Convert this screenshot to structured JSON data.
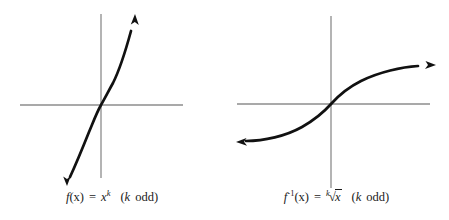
{
  "figures": [
    {
      "id": "power-function",
      "name": "odd-power-function-graph",
      "caption": {
        "fn_name": "f",
        "arg": "(x)",
        "equals": "=",
        "base": "x",
        "exponent": "k",
        "condition_open": "(",
        "condition_var": "k",
        "condition_text": "odd",
        "condition_close": ")",
        "plain": "f(x) = x^k  (k odd)"
      },
      "axes": {
        "x_axis": {
          "x1": 20,
          "y1": 105,
          "x2": 183,
          "y2": 105
        },
        "y_axis": {
          "x1": 101,
          "y1": 14,
          "x2": 101,
          "y2": 178
        },
        "color": "#8c8c8c"
      },
      "curve": {
        "color": "#111111",
        "width": 2.6,
        "path": "M 67 181 C 74 166 82 146 89 131 C 94 120 97 112 101 105 C 105 98 108 92 114 82 C 121 68 127 50 133 26",
        "arrow_start": {
          "x": 67,
          "y": 185,
          "direction": "down-left"
        },
        "arrow_end": {
          "x": 135,
          "y": 15,
          "direction": "up-right"
        }
      }
    },
    {
      "id": "inverse-root-function",
      "name": "odd-root-function-graph",
      "caption": {
        "fn_name": "f",
        "inverse_exponent": "-1",
        "arg": "(x)",
        "equals": "=",
        "radical_index": "k",
        "radical_sign": "√",
        "radicand": "x",
        "condition_open": "(",
        "condition_var": "k",
        "condition_text": "odd",
        "condition_close": ")",
        "plain": "f^-1(x) = k-th-root of x  (k odd)"
      },
      "axes": {
        "x_axis": {
          "x1": 13,
          "y1": 104,
          "x2": 206,
          "y2": 104
        },
        "y_axis": {
          "x1": 107,
          "y1": 16,
          "x2": 107,
          "y2": 188
        },
        "color": "#8c8c8c"
      },
      "curve": {
        "color": "#111111",
        "width": 2.6,
        "path": "M 17 141 C 36 141 60 137 78 128 C 92 121 99 114 107 104 C 115 94 122 87 136 80 C 154 71 178 67 197 66",
        "arrow_start": {
          "x": 13,
          "y": 142,
          "direction": "left"
        },
        "arrow_end": {
          "x": 211,
          "y": 65,
          "direction": "right"
        }
      }
    }
  ],
  "colors": {
    "background": "#ffffff",
    "axis": "#8c8c8c",
    "curve": "#111111",
    "text": "#1a1a1a"
  }
}
